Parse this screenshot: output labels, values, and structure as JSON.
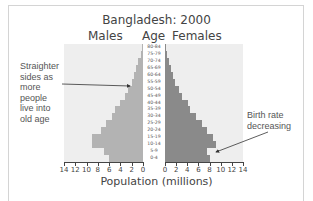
{
  "chart_data": {
    "type": "bar",
    "subtype": "population-pyramid",
    "title": "Bangladesh: 2000",
    "left_header": "Males",
    "center_header": "Age",
    "right_header": "Females",
    "xlabel": "Population (millions)",
    "ylabel": "Age",
    "xlim": [
      0,
      14
    ],
    "x_ticks_left": [
      "14",
      "12",
      "10",
      "8",
      "6",
      "4",
      "2",
      "0"
    ],
    "x_ticks_right": [
      "0",
      "2",
      "4",
      "6",
      "8",
      "10",
      "12",
      "14"
    ],
    "categories": [
      "80-84",
      "75-79",
      "70-74",
      "65-69",
      "60-64",
      "55-59",
      "50-54",
      "45-49",
      "40-44",
      "35-39",
      "30-34",
      "25-29",
      "20-24",
      "15-19",
      "10-14",
      "5-9",
      "0-4"
    ],
    "series": [
      {
        "name": "Males",
        "color": "#b3b3b3",
        "values": [
          0.2,
          0.4,
          0.8,
          1.2,
          1.6,
          2.0,
          2.6,
          3.2,
          4.0,
          5.0,
          5.5,
          6.5,
          7.5,
          9.0,
          9.0,
          7.0,
          6.0
        ]
      },
      {
        "name": "Females",
        "color": "#8a8a8a",
        "values": [
          0.2,
          0.4,
          0.7,
          1.0,
          1.4,
          1.8,
          2.4,
          3.0,
          4.0,
          4.5,
          5.5,
          6.5,
          7.5,
          8.5,
          9.0,
          7.5,
          8.0
        ]
      }
    ],
    "annotations": [
      {
        "text": "Straighter sides as more people live into old age",
        "points_to": "Males 55-59"
      },
      {
        "text": "Birth rate decreasing",
        "points_to": "Females 5-9"
      }
    ],
    "grid": false,
    "legend": "none"
  },
  "annotations": {
    "left_lines": [
      "Straighter",
      "sides as",
      "more",
      "people",
      "live into",
      "old age"
    ],
    "right_lines": [
      "Birth rate",
      "decreasing"
    ]
  }
}
